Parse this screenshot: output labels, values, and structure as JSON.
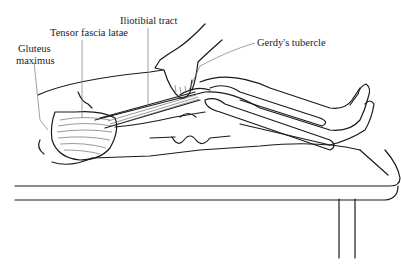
{
  "figure": {
    "type": "anatomical-illustration",
    "labels": [
      {
        "id": "iliotibial-tract",
        "text": "Iliotibial tract"
      },
      {
        "id": "tensor-fascia-latae",
        "text": "Tensor fascia latae"
      },
      {
        "id": "gluteus-maximus-line1",
        "text": "Gluteus"
      },
      {
        "id": "gluteus-maximus-line2",
        "text": "maximus"
      },
      {
        "id": "gerdys-tubercle",
        "text": "Gerdy's tubercle"
      }
    ]
  }
}
